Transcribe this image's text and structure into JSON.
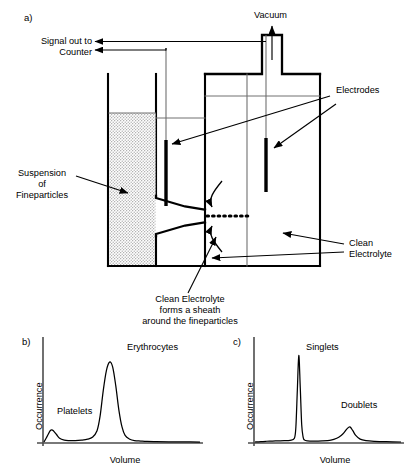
{
  "figure": {
    "panels": {
      "a_label": "a)",
      "b_label": "b)",
      "c_label": "c)"
    },
    "schematic": {
      "vacuum_label": "Vacuum",
      "signal_label_line1": "Signal out to",
      "signal_label_line2": "Counter",
      "electrodes_label": "Electrodes",
      "suspension_line1": "Suspension",
      "suspension_line2": "of",
      "suspension_line3": "Fineparticles",
      "clean_electrolyte_line1": "Clean",
      "clean_electrolyte_line2": "Electrolyte",
      "sheath_caption_line1": "Clean Electrolyte",
      "sheath_caption_line2": "forms a sheath",
      "sheath_caption_line3": "around the fineparticles"
    },
    "colors": {
      "ink": "#000000",
      "wire": "#595959",
      "stipple": "#d9d9d9",
      "background": "#ffffff"
    }
  },
  "chart_data": [
    {
      "type": "line",
      "panel": "b",
      "title": "",
      "xlabel": "Volume",
      "ylabel": "Occurrence",
      "grid": false,
      "legend": "none",
      "xlim": [
        0,
        100
      ],
      "ylim": [
        0,
        100
      ],
      "annotations": [
        {
          "text": "Platelets",
          "x": 14,
          "y": 30
        },
        {
          "text": "Erythrocytes",
          "x": 57,
          "y": 88
        }
      ],
      "series": [
        {
          "name": "Volume distribution",
          "peaks": [
            {
              "label": "Platelets",
              "center": 5,
              "height": 13,
              "width": 4
            },
            {
              "label": "Erythrocytes",
              "center": 42,
              "height": 85,
              "width": 8
            }
          ],
          "x": [
            0,
            2,
            4,
            5,
            6,
            8,
            10,
            13,
            16,
            20,
            24,
            28,
            31,
            34,
            36,
            38,
            40,
            42,
            44,
            46,
            48,
            50,
            52,
            55,
            58,
            62,
            66,
            72,
            80,
            90,
            100
          ],
          "values": [
            0,
            6,
            12,
            13,
            12,
            8,
            4,
            2,
            1.5,
            1.5,
            2,
            3,
            5,
            12,
            28,
            55,
            76,
            85,
            80,
            60,
            34,
            16,
            7,
            3,
            1.5,
            1,
            0.6,
            0.4,
            0.2,
            0.1,
            0
          ]
        }
      ]
    },
    {
      "type": "line",
      "panel": "c",
      "title": "",
      "xlabel": "Volume",
      "ylabel": "Occurrence",
      "grid": false,
      "legend": "none",
      "xlim": [
        0,
        100
      ],
      "ylim": [
        0,
        100
      ],
      "annotations": [
        {
          "text": "Singlets",
          "x": 40,
          "y": 86
        },
        {
          "text": "Doublets",
          "x": 72,
          "y": 40
        }
      ],
      "series": [
        {
          "name": "Volume distribution",
          "peaks": [
            {
              "label": "Singlets",
              "center": 30,
              "height": 92,
              "width": 2
            },
            {
              "label": "Doublets",
              "center": 63,
              "height": 16,
              "width": 5
            }
          ],
          "x": [
            0,
            4,
            8,
            12,
            16,
            20,
            24,
            27,
            28,
            29,
            30,
            31,
            32,
            33,
            34,
            36,
            40,
            46,
            52,
            56,
            59,
            61,
            63,
            65,
            67,
            69,
            72,
            76,
            82,
            90,
            100
          ],
          "values": [
            0,
            0.5,
            0.8,
            1,
            1.2,
            1.4,
            1.8,
            4,
            16,
            55,
            92,
            58,
            18,
            5,
            2,
            1.2,
            1,
            1.2,
            2,
            4,
            7,
            10,
            14,
            16,
            12,
            7,
            3,
            1.4,
            0.7,
            0.3,
            0
          ]
        }
      ]
    }
  ]
}
